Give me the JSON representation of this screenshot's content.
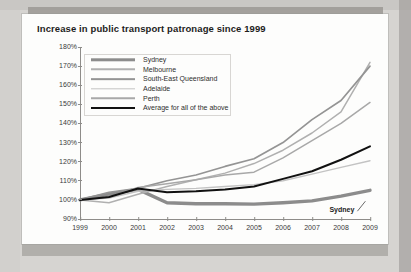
{
  "chart_data": {
    "type": "line",
    "title": "Increase in public transport patronage since 1999",
    "xlabel": "",
    "ylabel": "",
    "ylim": [
      90,
      180
    ],
    "ytick_labels": [
      "180%",
      "170%",
      "160%",
      "150%",
      "140%",
      "130%",
      "120%",
      "110%",
      "100%",
      "90%"
    ],
    "ytick_values": [
      180,
      170,
      160,
      150,
      140,
      130,
      120,
      110,
      100,
      90
    ],
    "grid": false,
    "legend_position": "upper-left-inside",
    "x": [
      1999,
      2000,
      2001,
      2002,
      2003,
      2004,
      2005,
      2006,
      2007,
      2008,
      2009
    ],
    "xtick_labels": [
      "1999",
      "2000",
      "2001",
      "2002",
      "2003",
      "2004",
      "2005",
      "2006",
      "2007",
      "2008",
      "2009"
    ],
    "series": [
      {
        "name": "Sydney",
        "color": "#8c8c8c",
        "width": 3.4,
        "values": [
          100,
          103,
          105.5,
          98.5,
          98,
          98,
          97.8,
          98.5,
          99.5,
          102,
          105
        ]
      },
      {
        "name": "Melbourne",
        "color": "#b0b0b0",
        "width": 1.5,
        "values": [
          100,
          98.5,
          103,
          107,
          110.5,
          114,
          119,
          126,
          135,
          146,
          172
        ]
      },
      {
        "name": "South-East Queensland",
        "color": "#949494",
        "width": 1.7,
        "values": [
          100,
          104,
          106,
          110,
          113,
          117.5,
          121.5,
          130,
          142,
          152,
          170
        ]
      },
      {
        "name": "Adelaide",
        "color": "#c3c3c3",
        "width": 1.4,
        "values": [
          100,
          101,
          104.5,
          105.5,
          106,
          107,
          108,
          110,
          113.5,
          117,
          120.5
        ]
      },
      {
        "name": "Perth",
        "color": "#a8a8a8",
        "width": 1.5,
        "values": [
          100,
          101.5,
          106.5,
          108.5,
          110.5,
          113,
          114.5,
          122,
          131,
          140,
          151
        ]
      },
      {
        "name": "Average for all of the above",
        "color": "#111111",
        "width": 2.0,
        "values": [
          100,
          101.5,
          106,
          104,
          104.5,
          105.5,
          107,
          111,
          115,
          121,
          128
        ]
      }
    ],
    "annotations": [
      {
        "text": "Sydney",
        "target_series": "Sydney",
        "x": 2007.6,
        "y": 94.6
      }
    ]
  }
}
